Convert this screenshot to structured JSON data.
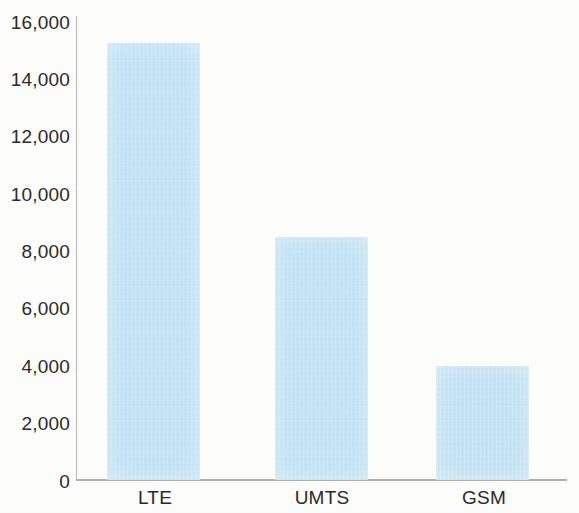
{
  "chart_data": {
    "type": "bar",
    "title": "",
    "subtitle": "",
    "xlabel": "",
    "ylabel": "",
    "categories": [
      "LTE",
      "UMTS",
      "GSM"
    ],
    "values": [
      15250,
      8500,
      4000
    ],
    "series": [
      {
        "name": "",
        "values": [
          15250,
          8500,
          4000
        ]
      }
    ],
    "ylim": [
      0,
      16000
    ],
    "ytick_labels": [
      "16,000",
      "14,000",
      "12,000",
      "10,000",
      "8,000",
      "6,000",
      "4,000",
      "2,000",
      "0"
    ],
    "ytick_values": [
      16000,
      14000,
      12000,
      10000,
      8000,
      6000,
      4000,
      2000,
      0
    ],
    "grid": false,
    "legend": "none",
    "bar_color": "#c3e3f5",
    "axis_color": "#b0b0ac",
    "text_color": "#2a2a2a",
    "background": "#fdfdfb"
  }
}
